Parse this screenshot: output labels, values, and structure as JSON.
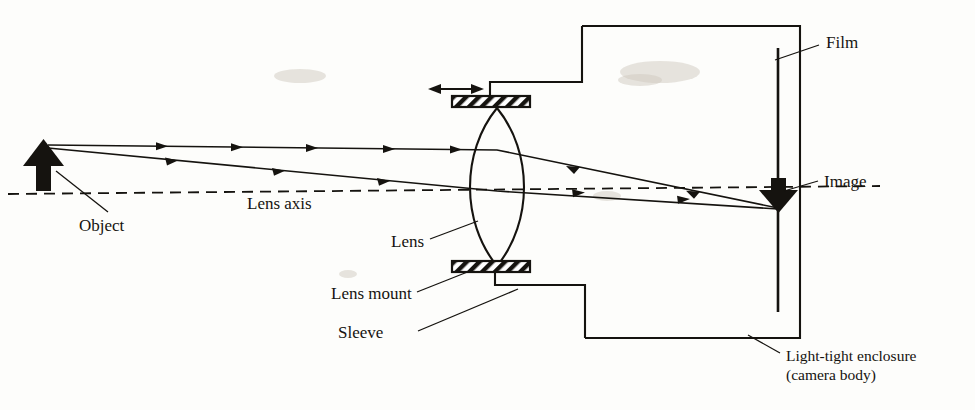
{
  "figure": {
    "type": "optics-diagram",
    "background_color": "#fdfdfb",
    "ink_color": "#15130f"
  },
  "labels": {
    "object": "Object",
    "lens_axis": "Lens axis",
    "lens": "Lens",
    "lens_mount": "Lens mount",
    "sleeve": "Sleeve",
    "film": "Film",
    "image": "Image",
    "enclosure_line1": "Light-tight enclosure",
    "enclosure_line2": "(camera body)"
  },
  "geometry": {
    "object_arrow": {
      "x": 43,
      "base_y": 190,
      "tip_y": 144
    },
    "lens_axis": {
      "x1": 8,
      "y1": 194,
      "x2": 880,
      "y2": 186
    },
    "lens": {
      "center_x": 497,
      "top_y": 108,
      "bottom_y": 266,
      "bulge": 36
    },
    "lens_mount_top": {
      "x": 452,
      "y": 96,
      "width": 78,
      "height": 11
    },
    "lens_mount_bottom": {
      "x": 452,
      "y": 261,
      "width": 78,
      "height": 11
    },
    "focus_arrow": {
      "x1": 430,
      "x2": 482,
      "y": 89
    },
    "film": {
      "x": 778,
      "y_top": 48,
      "y_bottom": 312
    },
    "image_arrow": {
      "x": 778,
      "base_y": 182,
      "tip_y": 211
    },
    "enclosure": {
      "left_x": 582,
      "right_x": 800,
      "top_y": 26,
      "bottom_y": 338
    },
    "sleeve_top": {
      "x1": 490,
      "y": 82,
      "x2": 582
    },
    "sleeve_bottom": {
      "x1": 495,
      "y": 285,
      "x2": 585
    },
    "rays": [
      {
        "name": "upper-ray",
        "from": [
          48,
          145
        ],
        "lens_hit": [
          497,
          148
        ],
        "to": [
          778,
          208
        ]
      },
      {
        "name": "lower-ray",
        "from": [
          48,
          147
        ],
        "lens_hit": [
          497,
          190
        ],
        "to": [
          778,
          209
        ]
      }
    ]
  },
  "annotations": {
    "object_leader": [
      108,
      212,
      56,
      171
    ],
    "lens_axis_text_pos": [
      248,
      206
    ],
    "lens_leader": [
      432,
      239,
      478,
      222
    ],
    "lens_mount_leader": [
      418,
      292,
      470,
      272
    ],
    "sleeve_leader": [
      420,
      332,
      516,
      290
    ],
    "film_leader": [
      818,
      46,
      776,
      60
    ],
    "image_leader": [
      817,
      181,
      786,
      190
    ],
    "enclosure_leader": [
      778,
      352,
      748,
      336
    ]
  }
}
